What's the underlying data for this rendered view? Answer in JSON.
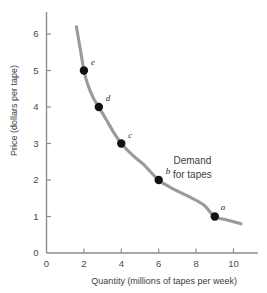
{
  "chart_data": {
    "type": "line",
    "title": "",
    "xlabel": "Quantity (millions of tapes per week)",
    "ylabel": "Price (dollars per tape)",
    "xlim": [
      0,
      11.3
    ],
    "ylim": [
      0,
      6.6
    ],
    "xticks": [
      "0",
      "2",
      "4",
      "6",
      "8",
      "10"
    ],
    "xtick_values": [
      0,
      2,
      4,
      6,
      8,
      10
    ],
    "yticks": [
      "0",
      "1",
      "2",
      "3",
      "4",
      "5",
      "6"
    ],
    "ytick_values": [
      0,
      1,
      2,
      3,
      4,
      5,
      6
    ],
    "grid": false,
    "legend": "none",
    "series": [
      {
        "name": "Demand for tapes",
        "kind": "curve",
        "color": "#9a9a9a",
        "x": [
          1.6,
          1.75,
          1.9,
          2.0,
          2.2,
          2.5,
          2.8,
          3.2,
          3.6,
          4.0,
          4.6,
          5.2,
          6.0,
          6.8,
          7.6,
          8.4,
          9.0,
          9.7,
          10.4
        ],
        "y": [
          6.2,
          5.75,
          5.3,
          5.0,
          4.62,
          4.25,
          4.0,
          3.65,
          3.3,
          3.0,
          2.68,
          2.42,
          2.0,
          1.75,
          1.55,
          1.32,
          1.0,
          0.9,
          0.8
        ]
      }
    ],
    "points": [
      {
        "label": "a",
        "x": 9.0,
        "y": 1.0,
        "label_dx": 6,
        "label_dy": -7
      },
      {
        "label": "b",
        "x": 6.0,
        "y": 2.0,
        "label_dx": 7,
        "label_dy": -6
      },
      {
        "label": "c",
        "x": 4.0,
        "y": 3.0,
        "label_dx": 7,
        "label_dy": -6
      },
      {
        "label": "d",
        "x": 2.8,
        "y": 4.0,
        "label_dx": 7,
        "label_dy": -6
      },
      {
        "label": "e",
        "x": 2.0,
        "y": 5.0,
        "label_dx": 7,
        "label_dy": -6
      }
    ],
    "point_color": "#111111",
    "point_radius": 4.2,
    "annotations": [
      {
        "text": "Demand",
        "x": 7.8,
        "y": 2.45
      },
      {
        "text": "for tapes",
        "x": 7.8,
        "y": 2.05
      }
    ],
    "axis_color": "#8d8d8d",
    "background": "#ffffff"
  }
}
